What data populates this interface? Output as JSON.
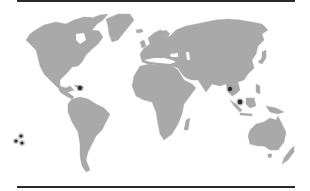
{
  "map": {
    "projection": "world",
    "colors": {
      "land": "#a9a9a9",
      "ocean": "#ffffff",
      "rule": "#2a2a2a",
      "marker": "#2a2a2a"
    },
    "rules": [
      "top",
      "bottom"
    ],
    "markers": [
      {
        "id": "caribbean",
        "region": "Caribbean",
        "x": 80,
        "y": 88,
        "r": 2.2
      },
      {
        "id": "indochina",
        "region": "Southeast Asia (Indochina)",
        "x": 230,
        "y": 89,
        "r": 2.2
      },
      {
        "id": "malaysia",
        "region": "Southeast Asia (Malay Peninsula)",
        "x": 240,
        "y": 102,
        "r": 2.4
      },
      {
        "id": "pacific-1",
        "region": "Eastern Pacific",
        "x": 21,
        "y": 136,
        "r": 1.6
      },
      {
        "id": "pacific-2",
        "region": "Eastern Pacific",
        "x": 16,
        "y": 141,
        "r": 1.6
      },
      {
        "id": "pacific-3",
        "region": "Eastern Pacific",
        "x": 22,
        "y": 143,
        "r": 1.6
      }
    ]
  }
}
